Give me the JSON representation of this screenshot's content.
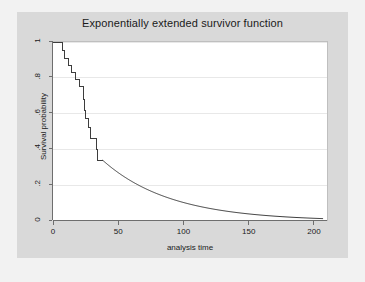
{
  "chart_data": {
    "type": "line",
    "title": "Exponentially extended survivor function",
    "xlabel": "analysis time",
    "ylabel": "Survival probability",
    "xlim": [
      0,
      210
    ],
    "ylim": [
      0,
      1
    ],
    "xticks": [
      0,
      50,
      100,
      150,
      200
    ],
    "xtick_labels": [
      "0",
      "50",
      "100",
      "150",
      "200"
    ],
    "yticks": [
      0,
      0.2,
      0.4,
      0.6,
      0.8,
      1
    ],
    "ytick_labels": [
      "0",
      ".2",
      ".4",
      ".6",
      ".8",
      "1"
    ],
    "grid": "horizontal",
    "legend": "none",
    "line_color": "#3d3d3d",
    "plot_bg": "#ffffff",
    "graph_bg": "#d9d9d9",
    "outer_bg": "#f2f2f2",
    "grid_color": "#e8e8e8",
    "series": [
      {
        "name": "Kaplan-Meier survivor step function",
        "style": "step",
        "points": [
          [
            0,
            1.0
          ],
          [
            7,
            1.0
          ],
          [
            7,
            0.95
          ],
          [
            9,
            0.95
          ],
          [
            9,
            0.91
          ],
          [
            12,
            0.91
          ],
          [
            12,
            0.87
          ],
          [
            14,
            0.87
          ],
          [
            14,
            0.83
          ],
          [
            17,
            0.83
          ],
          [
            17,
            0.79
          ],
          [
            20,
            0.79
          ],
          [
            20,
            0.75
          ],
          [
            23,
            0.75
          ],
          [
            23,
            0.68
          ],
          [
            24,
            0.68
          ],
          [
            24,
            0.62
          ],
          [
            25,
            0.62
          ],
          [
            25,
            0.57
          ],
          [
            27,
            0.57
          ],
          [
            27,
            0.52
          ],
          [
            29,
            0.52
          ],
          [
            29,
            0.46
          ],
          [
            33,
            0.46
          ],
          [
            33,
            0.4
          ],
          [
            34,
            0.4
          ],
          [
            34,
            0.34
          ],
          [
            38,
            0.34
          ]
        ]
      },
      {
        "name": "Exponential extension",
        "style": "smooth",
        "formula": "S(t) = 0.34 * exp(-(t - 38) / 52)",
        "anchor_t": 38,
        "anchor_s": 0.34,
        "rate": 0.0192,
        "t_end": 207,
        "points": [
          [
            38,
            0.34
          ],
          [
            45,
            0.3
          ],
          [
            55,
            0.25
          ],
          [
            65,
            0.21
          ],
          [
            75,
            0.17
          ],
          [
            85,
            0.14
          ],
          [
            95,
            0.12
          ],
          [
            105,
            0.1
          ],
          [
            115,
            0.08
          ],
          [
            125,
            0.067
          ],
          [
            135,
            0.055
          ],
          [
            145,
            0.046
          ],
          [
            155,
            0.038
          ],
          [
            165,
            0.031
          ],
          [
            175,
            0.026
          ],
          [
            185,
            0.021
          ],
          [
            195,
            0.018
          ],
          [
            207,
            0.014
          ]
        ]
      }
    ]
  }
}
